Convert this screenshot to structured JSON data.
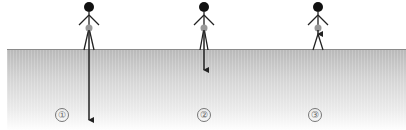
{
  "diagram": {
    "colors": {
      "figure": "#111111",
      "center_of_mass": "#999999",
      "ground_line": "#8a8a8a",
      "arrow": "#222222"
    },
    "figures": [
      {
        "id": 1,
        "label": "①",
        "x": 89,
        "arrow": "long",
        "arrow_end_y": 126
      },
      {
        "id": 2,
        "label": "②",
        "x": 204,
        "arrow": "medium",
        "arrow_end_y": 76
      },
      {
        "id": 3,
        "label": "③",
        "x": 318,
        "arrow": "short",
        "arrow_end_y": 40
      }
    ]
  }
}
